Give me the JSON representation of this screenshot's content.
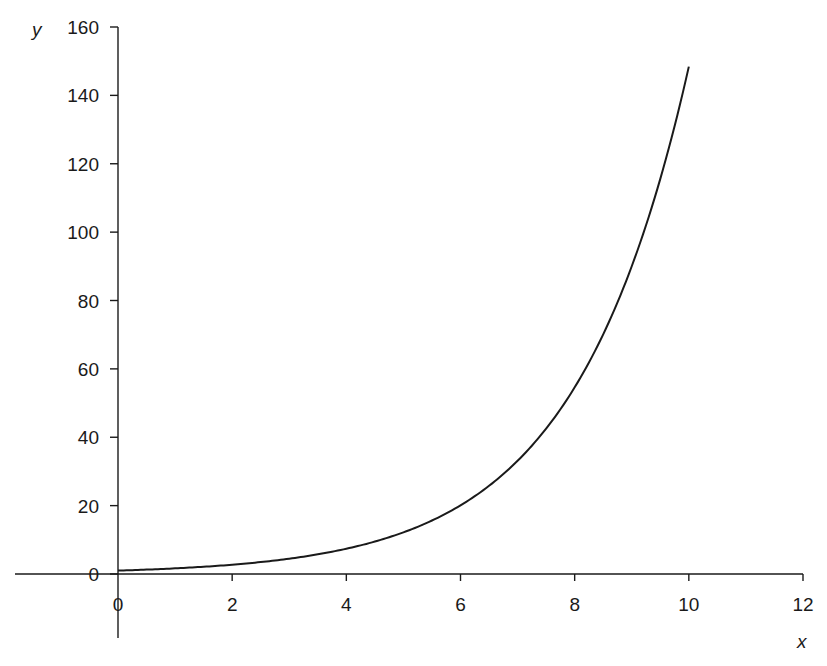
{
  "chart_data": {
    "type": "line",
    "title": "",
    "xlabel": "x",
    "ylabel": "y",
    "xlim": [
      0,
      12
    ],
    "ylim": [
      0,
      160
    ],
    "x_ticks": [
      0,
      2,
      4,
      6,
      8,
      10,
      12
    ],
    "y_ticks": [
      0,
      20,
      40,
      60,
      80,
      100,
      120,
      140,
      160
    ],
    "x_tick_labels": [
      "0",
      "2",
      "4",
      "6",
      "8",
      "10",
      "12"
    ],
    "y_tick_labels": [
      "0",
      "20",
      "40",
      "60",
      "80",
      "100",
      "120",
      "140",
      "160"
    ],
    "grid": false,
    "legend": null,
    "series": [
      {
        "name": "y = e^(x/2)",
        "color": "#1a1a1a",
        "x": [
          0,
          0.5,
          1,
          1.5,
          2,
          2.5,
          3,
          3.5,
          4,
          4.5,
          5,
          5.5,
          6,
          6.5,
          7,
          7.5,
          8,
          8.5,
          9,
          9.5,
          10
        ],
        "values": [
          1.0,
          1.28,
          1.65,
          2.12,
          2.72,
          3.49,
          4.48,
          5.75,
          7.39,
          9.49,
          12.18,
          15.64,
          20.09,
          25.79,
          33.12,
          42.52,
          54.6,
          70.11,
          90.02,
          115.58,
          148.41
        ]
      }
    ]
  },
  "labels": {
    "x_axis": "x",
    "y_axis": "y"
  }
}
